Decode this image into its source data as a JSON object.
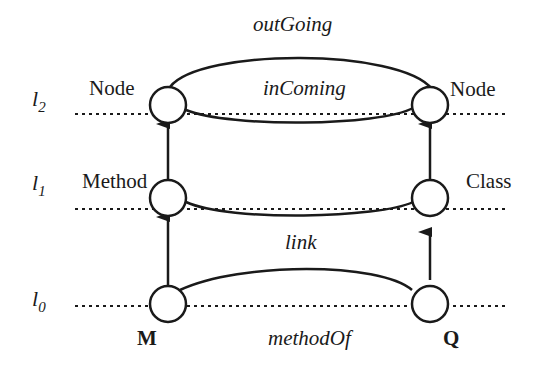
{
  "diagram": {
    "levels": [
      {
        "id": "l2",
        "label": "l",
        "sub": "2"
      },
      {
        "id": "l1",
        "label": "l",
        "sub": "1"
      },
      {
        "id": "l0",
        "label": "l",
        "sub": "0"
      }
    ],
    "nodes": {
      "left_l2": "Node",
      "right_l2": "Node",
      "left_l1": "Method",
      "right_l1": "Class",
      "left_l0": "M",
      "right_l0": "Q"
    },
    "edges": {
      "outgoing": "outGoing",
      "incoming": "inComing",
      "link": "link",
      "methodof": "methodOf"
    },
    "colors": {
      "stroke": "#1a1a1a",
      "background": "#ffffff"
    }
  }
}
